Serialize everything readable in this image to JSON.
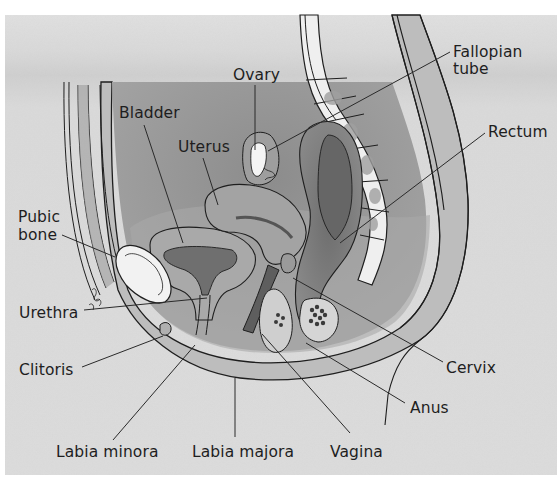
{
  "figure": {
    "type": "anatomical-diagram",
    "colors": {
      "page_background": "#ffffff",
      "panel_background": "#dcdcdc",
      "panel_shadow_band": "#cfcfcf",
      "abdominal_cavity": "#9a9a9a",
      "organ_mid": "#b4b4b4",
      "organ_dark": "#7d7d7d",
      "bone": "#f2f2f2",
      "outline": "#1e1e1e",
      "label_text": "#1e1e1e"
    }
  },
  "labels": [
    {
      "id": "ovary",
      "lines": [
        "Ovary"
      ],
      "x": 233,
      "y": 80,
      "leader": [
        [
          255,
          85
        ],
        [
          255,
          150
        ]
      ]
    },
    {
      "id": "fallopian-tube",
      "lines": [
        "Fallopian",
        "tube"
      ],
      "x": 453,
      "y": 57,
      "leader": [
        [
          450,
          52
        ],
        [
          268,
          151
        ]
      ]
    },
    {
      "id": "bladder",
      "lines": [
        "Bladder"
      ],
      "x": 119,
      "y": 118,
      "leader": [
        [
          144,
          125
        ],
        [
          183,
          243
        ]
      ]
    },
    {
      "id": "uterus",
      "lines": [
        "Uterus"
      ],
      "x": 178,
      "y": 152,
      "leader": [
        [
          203,
          158
        ],
        [
          218,
          205
        ]
      ]
    },
    {
      "id": "rectum",
      "lines": [
        "Rectum"
      ],
      "x": 488,
      "y": 137,
      "leader": [
        [
          485,
          133
        ],
        [
          340,
          243
        ]
      ]
    },
    {
      "id": "pubic-bone",
      "lines": [
        "Pubic",
        "bone"
      ],
      "x": 18,
      "y": 222,
      "leader": [
        [
          62,
          235
        ],
        [
          115,
          257
        ]
      ]
    },
    {
      "id": "urethra",
      "lines": [
        "Urethra"
      ],
      "x": 19,
      "y": 318,
      "leader": [
        [
          84,
          310
        ],
        [
          207,
          298
        ]
      ]
    },
    {
      "id": "clitoris",
      "lines": [
        "Clitoris"
      ],
      "x": 19,
      "y": 375,
      "leader": [
        [
          82,
          367
        ],
        [
          163,
          336
        ]
      ]
    },
    {
      "id": "cervix",
      "lines": [
        "Cervix"
      ],
      "x": 446,
      "y": 373,
      "leader": [
        [
          443,
          362
        ],
        [
          293,
          278
        ]
      ]
    },
    {
      "id": "anus",
      "lines": [
        "Anus"
      ],
      "x": 410,
      "y": 413,
      "leader": [
        [
          405,
          403
        ],
        [
          306,
          343
        ]
      ]
    },
    {
      "id": "labia-minora",
      "lines": [
        "Labia minora"
      ],
      "x": 56,
      "y": 457,
      "leader": [
        [
          113,
          440
        ],
        [
          195,
          345
        ]
      ]
    },
    {
      "id": "labia-majora",
      "lines": [
        "Labia majora"
      ],
      "x": 192,
      "y": 457,
      "leader": [
        [
          235,
          437
        ],
        [
          235,
          378
        ]
      ]
    },
    {
      "id": "vagina",
      "lines": [
        "Vagina"
      ],
      "x": 330,
      "y": 457,
      "leader": [
        [
          350,
          433
        ],
        [
          262,
          334
        ]
      ]
    }
  ]
}
